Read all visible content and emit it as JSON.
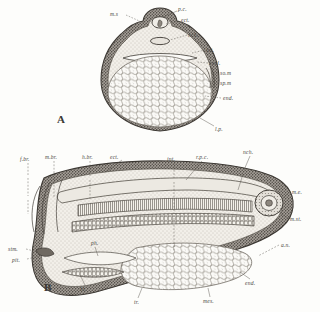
{
  "plate": {
    "background_color": "#fdfdfb",
    "ink_color": "#4a4742",
    "figures": [
      {
        "letter": "A",
        "caption_letter_x": 57,
        "caption_letter_y": 118,
        "description": "transverse section of embryo"
      },
      {
        "letter": "B",
        "caption_letter_x": 44,
        "caption_letter_y": 286,
        "description": "longitudinal section of embryo"
      }
    ],
    "figure_a_labels": [
      {
        "text": "m.s",
        "x": 110,
        "y": 12
      },
      {
        "text": "p.c.",
        "x": 178,
        "y": 7
      },
      {
        "text": "ect.",
        "x": 181,
        "y": 18
      },
      {
        "text": "nch.",
        "x": 188,
        "y": 33
      },
      {
        "text": "int.",
        "x": 206,
        "y": 48
      },
      {
        "text": "coel.",
        "x": 209,
        "y": 61
      },
      {
        "text": "so.m",
        "x": 220,
        "y": 71
      },
      {
        "text": "sp.m",
        "x": 220,
        "y": 81
      },
      {
        "text": "end.",
        "x": 223,
        "y": 96
      },
      {
        "text": "l.p.",
        "x": 215,
        "y": 127
      }
    ],
    "figure_b_labels": [
      {
        "text": "f.br.",
        "x": 20,
        "y": 157
      },
      {
        "text": "m.br.",
        "x": 45,
        "y": 155
      },
      {
        "text": "h.br.",
        "x": 82,
        "y": 155
      },
      {
        "text": "ect.",
        "x": 110,
        "y": 155
      },
      {
        "text": "int.",
        "x": 167,
        "y": 157
      },
      {
        "text": "r.p.c.",
        "x": 196,
        "y": 155
      },
      {
        "text": "nch.",
        "x": 243,
        "y": 150
      },
      {
        "text": "m.e.",
        "x": 292,
        "y": 190
      },
      {
        "text": "m.st.",
        "x": 290,
        "y": 217
      },
      {
        "text": "a.n.",
        "x": 281,
        "y": 243
      },
      {
        "text": "stm.",
        "x": 8,
        "y": 247
      },
      {
        "text": "pit.",
        "x": 12,
        "y": 258
      },
      {
        "text": "ph.",
        "x": 91,
        "y": 241
      },
      {
        "text": "ht.",
        "x": 80,
        "y": 287
      },
      {
        "text": "tr.",
        "x": 134,
        "y": 300
      },
      {
        "text": "mes.",
        "x": 203,
        "y": 299
      },
      {
        "text": "end.",
        "x": 245,
        "y": 281
      }
    ]
  }
}
